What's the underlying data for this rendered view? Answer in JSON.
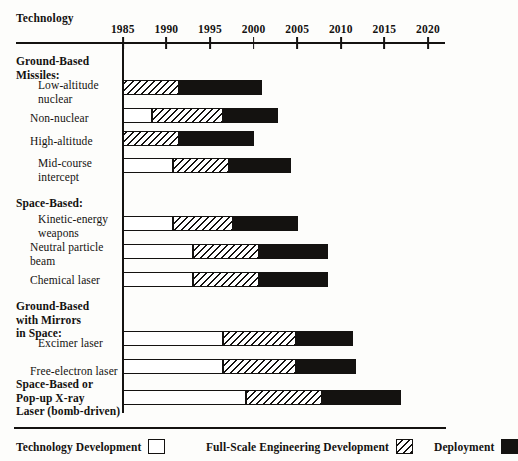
{
  "header": {
    "technology_label": "Technology"
  },
  "axis": {
    "years": [
      "1985",
      "1990",
      "1995",
      "2000",
      "2005",
      "2010",
      "2015",
      "2020"
    ],
    "year_values": [
      1985,
      1990,
      1995,
      2000,
      2005,
      2010,
      2015,
      2020
    ],
    "min": 1985,
    "max": 2022
  },
  "legend": {
    "items": [
      {
        "label": "Technology Development",
        "swatch": "tech",
        "color": "#ffffff"
      },
      {
        "label": "Full-Scale Engineering Development",
        "swatch": "fse",
        "color": "#141210"
      },
      {
        "label": "Deployment",
        "swatch": "deploy",
        "color": "#141210"
      }
    ]
  },
  "groups": [
    {
      "title": "Ground-Based\nMissiles:"
    },
    {
      "title": "Space-Based:"
    },
    {
      "title": "Ground-Based\nwith Mirrors\nin Space:"
    },
    {
      "title": "Space-Based or\nPop-up X-ray\nLaser (bomb-driven)"
    }
  ],
  "rows": [
    {
      "label": "Low-altitude\nnuclear",
      "bold": false
    },
    {
      "label": "Non-nuclear",
      "bold": false
    },
    {
      "label": "High-altitude",
      "bold": false
    },
    {
      "label": "Mid-course\nintercept",
      "bold": false
    },
    {
      "label": "Kinetic-energy\nweapons",
      "bold": false
    },
    {
      "label": "Neutral particle\nbeam",
      "bold": false
    },
    {
      "label": "Chemical laser",
      "bold": false
    },
    {
      "label": "Excimer laser",
      "bold": false
    },
    {
      "label": "Free-electron laser",
      "bold": false
    },
    {
      "label": "Space-Based or Pop-up X-ray Laser (bomb-driven)",
      "bold": true
    }
  ],
  "chart_data": {
    "type": "bar",
    "title": "",
    "subtitle": "",
    "xlabel": "",
    "ylabel": "Technology",
    "orientation": "horizontal",
    "stacked": true,
    "grid": false,
    "legend_position": "bottom",
    "xlim": [
      1985,
      2022
    ],
    "xticks": [
      1985,
      1990,
      1995,
      2000,
      2005,
      2010,
      2015,
      2020
    ],
    "phases": [
      "Technology Development",
      "Full-Scale Engineering Development",
      "Deployment"
    ],
    "categories": [
      "Low-altitude nuclear",
      "Non-nuclear",
      "High-altitude",
      "Mid-course intercept",
      "Kinetic-energy weapons",
      "Neutral particle beam",
      "Chemical laser",
      "Excimer laser",
      "Free-electron laser",
      "Space-Based or Pop-up X-ray Laser (bomb-driven)"
    ],
    "bars": [
      {
        "category": "Low-altitude nuclear",
        "group": "Ground-Based Missiles:",
        "tech_dev": [
          1985,
          1985
        ],
        "full_scale": [
          1985,
          1991.5
        ],
        "deployment": [
          1991.5,
          2001.0
        ]
      },
      {
        "category": "Non-nuclear",
        "group": "Ground-Based Missiles:",
        "tech_dev": [
          1985,
          1988.3
        ],
        "full_scale": [
          1988.3,
          1996.5
        ],
        "deployment": [
          1996.5,
          2002.8
        ]
      },
      {
        "category": "High-altitude",
        "group": "Ground-Based Missiles:",
        "tech_dev": [
          1985,
          1985
        ],
        "full_scale": [
          1985,
          1991.5
        ],
        "deployment": [
          1991.5,
          2000.0
        ]
      },
      {
        "category": "Mid-course intercept",
        "group": "Ground-Based Missiles:",
        "tech_dev": [
          1985,
          1990.7
        ],
        "full_scale": [
          1990.7,
          1997.2
        ],
        "deployment": [
          1997.2,
          2004.3
        ]
      },
      {
        "category": "Kinetic-energy weapons",
        "group": "Space-Based:",
        "tech_dev": [
          1985,
          1990.8
        ],
        "full_scale": [
          1990.8,
          1997.6
        ],
        "deployment": [
          1997.6,
          2005.1
        ]
      },
      {
        "category": "Neutral particle beam",
        "group": "Space-Based:",
        "tech_dev": [
          1985,
          1993.0
        ],
        "full_scale": [
          1993.0,
          2000.6
        ],
        "deployment": [
          2000.6,
          2008.5
        ]
      },
      {
        "category": "Chemical laser",
        "group": "Space-Based:",
        "tech_dev": [
          1985,
          1993.0
        ],
        "full_scale": [
          1993.0,
          2000.6
        ],
        "deployment": [
          2000.6,
          2008.5
        ]
      },
      {
        "category": "Excimer laser",
        "group": "Ground-Based with Mirrors in Space:",
        "tech_dev": [
          1985,
          1996.5
        ],
        "full_scale": [
          1996.5,
          2004.9
        ],
        "deployment": [
          2004.9,
          2011.4
        ]
      },
      {
        "category": "Free-electron laser",
        "group": "Ground-Based with Mirrors in Space:",
        "tech_dev": [
          1985,
          1996.5
        ],
        "full_scale": [
          1996.5,
          2004.9
        ],
        "deployment": [
          2004.9,
          2011.7
        ]
      },
      {
        "category": "Space-Based or Pop-up X-ray Laser (bomb-driven)",
        "group": "Space-Based or Pop-up X-ray Laser (bomb-driven)",
        "tech_dev": [
          1985,
          1999.1
        ],
        "full_scale": [
          1999.1,
          2007.9
        ],
        "deployment": [
          2007.9,
          2016.9
        ]
      }
    ]
  },
  "layout": {
    "axis_left_px": 122.8,
    "px_per_year": 8.72,
    "rows_top_px": [
      {
        "y": 80.0,
        "label_y": 79.0
      },
      {
        "y": 108.0,
        "label_y": 108.5
      },
      {
        "y": 131.0,
        "label_y": 131.5
      },
      {
        "y": 158.0,
        "label_y": 157.0
      },
      {
        "y": 216.0,
        "label_y": 215.0
      },
      {
        "y": 244.0,
        "label_y": 243.0
      },
      {
        "y": 272.0,
        "label_y": 271.5
      },
      {
        "y": 331.0,
        "label_y": 330.5
      },
      {
        "y": 359.0,
        "label_y": 358.5
      },
      {
        "y": 390.0,
        "label_y": 378.0
      }
    ],
    "group_tops_px": [
      55,
      197,
      300,
      378
    ]
  }
}
